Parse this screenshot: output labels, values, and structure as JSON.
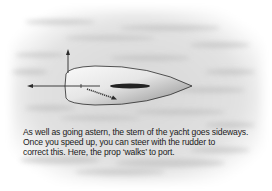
{
  "diagram": {
    "elements": {
      "hull": "yacht hull seen from above, bow pointing right",
      "keel": "dark elongated keel shape on hull centerline",
      "arrow_astern": "arrow pointing left from stern (going astern)",
      "arrow_sideways": "arrow pointing up from stern (stern moves sideways)",
      "prop_walk_arrow": "diagonal textured arrow under stern showing prop walk"
    },
    "colors": {
      "hull_light": "#f4f4f4",
      "hull_dark": "#8a8a8a",
      "keel": "#222222",
      "arrow": "#2b2b2b",
      "water": "#d8d8d8"
    }
  },
  "caption": {
    "lines": [
      "As well as going astern, the stern of the yacht goes sideways.",
      "Once you speed up, you can steer with the rudder to",
      "correct this. Here, the prop ‘walks’ to port."
    ]
  }
}
